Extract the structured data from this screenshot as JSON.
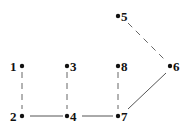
{
  "diagram": {
    "type": "graph",
    "nodes": [
      {
        "id": "1",
        "label": "1",
        "x": 22,
        "y": 66,
        "label_side": "left"
      },
      {
        "id": "2",
        "label": "2",
        "x": 22,
        "y": 116,
        "label_side": "left"
      },
      {
        "id": "3",
        "label": "3",
        "x": 67,
        "y": 66,
        "label_side": "right"
      },
      {
        "id": "4",
        "label": "4",
        "x": 67,
        "y": 116,
        "label_side": "right"
      },
      {
        "id": "5",
        "label": "5",
        "x": 118,
        "y": 16,
        "label_side": "right"
      },
      {
        "id": "6",
        "label": "6",
        "x": 170,
        "y": 66,
        "label_side": "right"
      },
      {
        "id": "7",
        "label": "7",
        "x": 118,
        "y": 116,
        "label_side": "right"
      },
      {
        "id": "8",
        "label": "8",
        "x": 118,
        "y": 66,
        "label_side": "right"
      }
    ],
    "edges": [
      {
        "from": "1",
        "to": "2",
        "style": "dashed"
      },
      {
        "from": "3",
        "to": "4",
        "style": "dashed"
      },
      {
        "from": "8",
        "to": "7",
        "style": "dashed"
      },
      {
        "from": "5",
        "to": "6",
        "style": "dashed"
      },
      {
        "from": "2",
        "to": "4",
        "style": "solid"
      },
      {
        "from": "4",
        "to": "7",
        "style": "solid"
      },
      {
        "from": "7",
        "to": "6",
        "style": "solid"
      }
    ],
    "colors": {
      "node": "#111111",
      "edge_solid": "#555555",
      "edge_dashed": "#666666",
      "background": "#ffffff"
    }
  }
}
